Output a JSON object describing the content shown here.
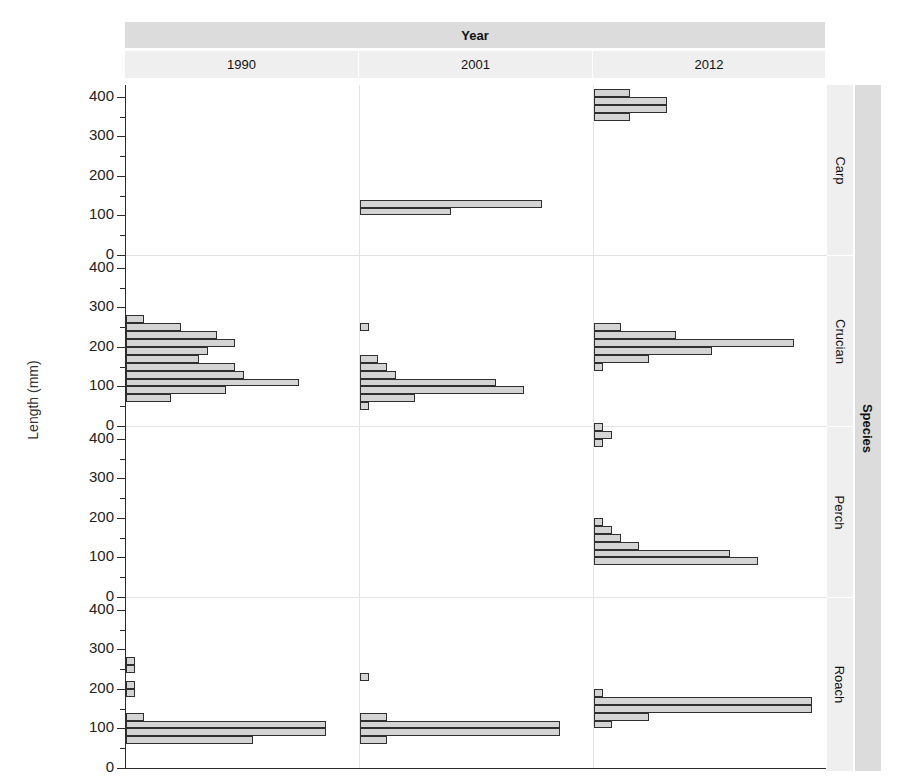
{
  "chart_data": {
    "type": "bar",
    "orientation": "horizontal",
    "title": "",
    "xlabel": "",
    "ylabel": "Length (mm)",
    "ylim": [
      0,
      430
    ],
    "grid": false,
    "legend_position": "none",
    "layout": "trellis 4 rows (Species) x 3 columns (Year)",
    "column_strip_label": "Year",
    "row_strip_label": "Species",
    "columns": [
      "1990",
      "2001",
      "2012"
    ],
    "rows": [
      "Carp",
      "Crucian",
      "Perch",
      "Roach"
    ],
    "y_ticks": [
      0,
      100,
      200,
      300,
      400
    ],
    "y_minor_ticks": [
      50,
      150,
      250,
      350
    ],
    "bin_width_mm": 20,
    "panels": [
      {
        "row": "Carp",
        "column": "1990",
        "bins": [],
        "counts": []
      },
      {
        "row": "Carp",
        "column": "2001",
        "bins": [
          100,
          120
        ],
        "counts": [
          10,
          20
        ]
      },
      {
        "row": "Carp",
        "column": "2012",
        "bins": [
          340,
          360,
          380,
          400
        ],
        "counts": [
          4,
          8,
          8,
          4
        ]
      },
      {
        "row": "Crucian",
        "column": "1990",
        "bins": [
          60,
          80,
          100,
          120,
          140,
          160,
          180,
          200,
          220,
          240,
          260
        ],
        "counts": [
          5,
          11,
          19,
          13,
          12,
          8,
          9,
          12,
          10,
          6,
          2
        ]
      },
      {
        "row": "Crucian",
        "column": "2001",
        "bins": [
          40,
          60,
          80,
          100,
          120,
          140,
          160,
          240
        ],
        "counts": [
          1,
          6,
          18,
          15,
          4,
          3,
          2,
          1
        ]
      },
      {
        "row": "Crucian",
        "column": "2012",
        "bins": [
          140,
          160,
          180,
          200,
          220,
          240
        ],
        "counts": [
          1,
          6,
          13,
          22,
          9,
          3
        ]
      },
      {
        "row": "Perch",
        "column": "1990",
        "bins": [],
        "counts": []
      },
      {
        "row": "Perch",
        "column": "2001",
        "bins": [],
        "counts": []
      },
      {
        "row": "Perch",
        "column": "2012",
        "bins": [
          80,
          100,
          120,
          140,
          160,
          180,
          380,
          400,
          420
        ],
        "counts": [
          18,
          15,
          5,
          3,
          2,
          1,
          1,
          2,
          1
        ]
      },
      {
        "row": "Roach",
        "column": "1990",
        "bins": [
          60,
          80,
          100,
          120,
          180,
          200,
          240,
          260
        ],
        "counts": [
          14,
          22,
          22,
          2,
          1,
          1,
          1,
          1
        ]
      },
      {
        "row": "Roach",
        "column": "2001",
        "bins": [
          60,
          80,
          100,
          120,
          220
        ],
        "counts": [
          3,
          22,
          22,
          3,
          1
        ]
      },
      {
        "row": "Roach",
        "column": "2012",
        "bins": [
          100,
          120,
          140,
          160,
          180
        ],
        "counts": [
          2,
          6,
          24,
          24,
          1
        ]
      }
    ]
  },
  "axes": {
    "y_title": "Length (mm)",
    "y_tick_labels_panel": [
      "400",
      "300",
      "200",
      "100",
      "0"
    ]
  },
  "strips": {
    "year": "Year",
    "species": "Species",
    "years": [
      "1990",
      "2001",
      "2012"
    ],
    "species_list": [
      "Carp",
      "Crucian",
      "Perch",
      "Roach"
    ]
  },
  "colors": {
    "bar_fill": "#d4d4d4",
    "bar_stroke": "#2f2f2f",
    "strip_outer": "#dcdcdc",
    "strip_inner": "#efefef",
    "axis": "#2b2b2b",
    "background": "#ffffff"
  }
}
